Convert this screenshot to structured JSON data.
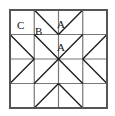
{
  "diagram": {
    "type": "quilt-block-grid",
    "canvas": {
      "width": 115,
      "height": 116,
      "background": "#ffffff"
    },
    "frame": {
      "x": 10,
      "y": 10,
      "width": 97,
      "height": 98,
      "stroke": "#555555",
      "stroke_width": 2
    },
    "grid": {
      "rows": 4,
      "cols": 4,
      "x_positions": [
        10,
        34.25,
        58.5,
        82.75,
        107
      ],
      "y_positions": [
        10,
        34.5,
        59,
        83.5,
        108
      ],
      "stroke": "#777777",
      "stroke_width": 1.2
    },
    "diagonal_stroke": "#1a1a1a",
    "diagonal_width": 1.3,
    "labels": [
      {
        "text": "C",
        "x": 17,
        "y": 20,
        "cell": "r0c0"
      },
      {
        "text": "B",
        "x": 35,
        "y": 26,
        "cell": "r0c1"
      },
      {
        "text": "A",
        "x": 57,
        "y": 19,
        "cell": "r0c2"
      },
      {
        "text": "A",
        "x": 57,
        "y": 42,
        "cell": "r1c2"
      }
    ],
    "segments": [
      {
        "name": "top-v-left",
        "x1": 34.25,
        "y1": 10,
        "x2": 58.5,
        "y2": 34.5
      },
      {
        "name": "top-v-right",
        "x1": 58.5,
        "y1": 34.5,
        "x2": 82.75,
        "y2": 10
      },
      {
        "name": "center-x-down",
        "x1": 34.25,
        "y1": 34.5,
        "x2": 82.75,
        "y2": 83.5
      },
      {
        "name": "center-x-up",
        "x1": 34.25,
        "y1": 83.5,
        "x2": 82.75,
        "y2": 34.5
      },
      {
        "name": "left-arrow-upper",
        "x1": 10,
        "y1": 34.5,
        "x2": 34.25,
        "y2": 59
      },
      {
        "name": "left-arrow-lower",
        "x1": 34.25,
        "y1": 59,
        "x2": 10,
        "y2": 83.5
      },
      {
        "name": "right-arrow-upper",
        "x1": 107,
        "y1": 34.5,
        "x2": 82.75,
        "y2": 59
      },
      {
        "name": "right-arrow-lower",
        "x1": 82.75,
        "y1": 59,
        "x2": 107,
        "y2": 83.5
      },
      {
        "name": "bottom-peak-left",
        "x1": 34.25,
        "y1": 108,
        "x2": 58.5,
        "y2": 83.5
      },
      {
        "name": "bottom-peak-right",
        "x1": 58.5,
        "y1": 83.5,
        "x2": 82.75,
        "y2": 108
      }
    ],
    "patch_labels": {
      "A": "A",
      "B": "B",
      "C": "C"
    }
  }
}
